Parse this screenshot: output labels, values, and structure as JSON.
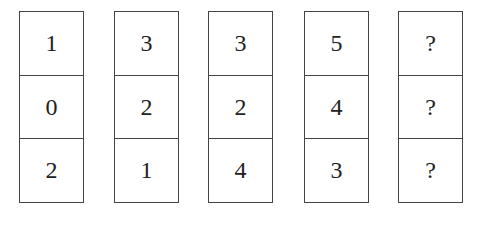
{
  "puzzle": {
    "columns": [
      {
        "cells": [
          "1",
          "0",
          "2"
        ]
      },
      {
        "cells": [
          "3",
          "2",
          "1"
        ]
      },
      {
        "cells": [
          "3",
          "2",
          "4"
        ]
      },
      {
        "cells": [
          "5",
          "4",
          "3"
        ]
      },
      {
        "cells": [
          "?",
          "?",
          "?"
        ]
      }
    ]
  }
}
